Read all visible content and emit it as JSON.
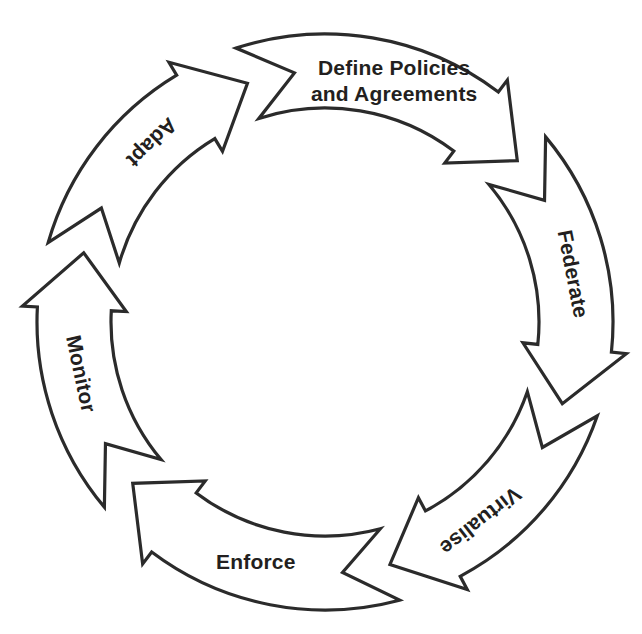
{
  "diagram": {
    "type": "circular-process-cycle",
    "title": "",
    "direction": "clockwise",
    "center": {
      "x": 325,
      "y": 322
    },
    "outer_radius": 288,
    "inner_radius": 214,
    "colors": {
      "stroke": "#2b2b2b",
      "fill": "#ffffff",
      "text": "#231f20",
      "background": "#ffffff"
    },
    "segments": [
      {
        "id": "define-policies-and-agreements",
        "label": "Define Policies and Agreements",
        "line1": "Define Policies",
        "line2": "and Agreements",
        "lines": 2,
        "order": 1,
        "start_angle": -108,
        "end_angle": -40,
        "label_angle": -74,
        "label_rotation": 0,
        "orientation": "horizontal"
      },
      {
        "id": "federate",
        "label": "Federate",
        "line1": "Federate",
        "line2": "",
        "lines": 1,
        "order": 2,
        "start_angle": -40,
        "end_angle": 19,
        "label_angle": -11,
        "label_rotation": 79,
        "orientation": "along-arc"
      },
      {
        "id": "virtualise",
        "label": "Virtualise",
        "line1": "Virtualise",
        "line2": "",
        "lines": 1,
        "order": 3,
        "start_angle": 19,
        "end_angle": 75,
        "label_angle": 52,
        "label_rotation": 142,
        "orientation": "along-arc"
      },
      {
        "id": "enforce",
        "label": "Enforce",
        "line1": "Enforce",
        "line2": "",
        "lines": 1,
        "order": 4,
        "start_angle": 75,
        "end_angle": 140,
        "label_angle": 106,
        "label_rotation": 0,
        "orientation": "horizontal"
      },
      {
        "id": "monitor",
        "label": "Monitor",
        "line1": "Monitor",
        "line2": "",
        "lines": 1,
        "order": 5,
        "start_angle": 140,
        "end_angle": 196,
        "label_angle": 168,
        "label_rotation": 78,
        "orientation": "along-arc"
      },
      {
        "id": "adapt",
        "label": "Adapt",
        "line1": "Adapt",
        "line2": "",
        "lines": 1,
        "order": 6,
        "start_angle": 196,
        "end_angle": 252,
        "label_angle": 226,
        "label_rotation": 136,
        "orientation": "along-arc"
      }
    ]
  }
}
